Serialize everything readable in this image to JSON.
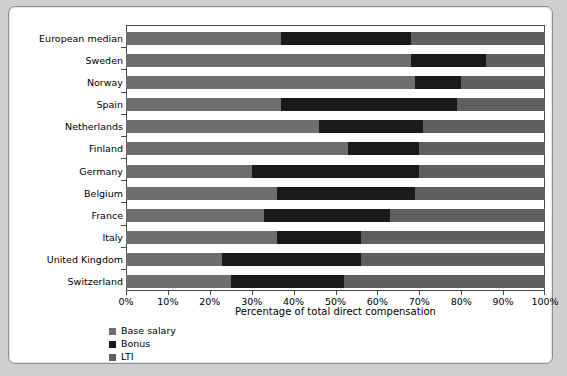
{
  "chart_data": {
    "type": "bar",
    "orientation": "horizontal",
    "stacked": true,
    "title": "",
    "xlabel": "Percentage of total direct compensation",
    "ylabel": "",
    "xlim": [
      0,
      100
    ],
    "grid": false,
    "legend_position": "bottom-left",
    "categories": [
      "European median",
      "Sweden",
      "Norway",
      "Spain",
      "Netherlands",
      "Finland",
      "Germany",
      "Belgium",
      "France",
      "Italy",
      "United Kingdom",
      "Switzerland"
    ],
    "tick_labels": [
      "0%",
      "10%",
      "20%",
      "30%",
      "40%",
      "50%",
      "60%",
      "70%",
      "80%",
      "90%",
      "100%"
    ],
    "tick_values": [
      0,
      10,
      20,
      30,
      40,
      50,
      60,
      70,
      80,
      90,
      100
    ],
    "series": [
      {
        "name": "Base salary",
        "color": "#6e6e6e",
        "values": [
          37,
          68,
          69,
          37,
          46,
          53,
          30,
          36,
          33,
          36,
          23,
          25
        ]
      },
      {
        "name": "Bonus",
        "color": "#1a1a1a",
        "values": [
          31,
          18,
          11,
          42,
          25,
          17,
          40,
          33,
          30,
          20,
          33,
          27
        ]
      },
      {
        "name": "LTI",
        "color": "#5f5f5f",
        "values": [
          32,
          14,
          20,
          21,
          29,
          30,
          30,
          31,
          37,
          44,
          44,
          48
        ]
      }
    ]
  }
}
